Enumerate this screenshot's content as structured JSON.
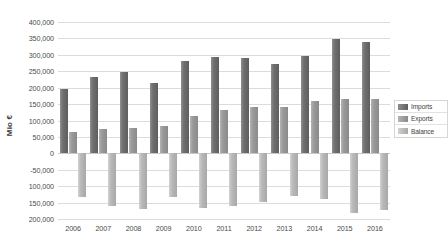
{
  "chart_data": {
    "type": "bar",
    "title": "",
    "subtitle": "",
    "xlabel": "",
    "ylabel": "Mio €",
    "categories": [
      "2006",
      "2007",
      "2008",
      "2009",
      "2010",
      "2011",
      "2012",
      "2013",
      "2014",
      "2015",
      "2016"
    ],
    "series": [
      {
        "name": "Imports",
        "color": "#6f6f6f",
        "values": [
          197000,
          233000,
          248000,
          215000,
          281000,
          292000,
          289000,
          272000,
          296000,
          347000,
          338000
        ]
      },
      {
        "name": "Exports",
        "color": "#9a9a9a",
        "values": [
          64000,
          73000,
          78000,
          83000,
          113000,
          133000,
          141000,
          142000,
          158000,
          166000,
          166000
        ]
      },
      {
        "name": "Balance",
        "color": "#b9b9b9",
        "values": [
          -133000,
          -160000,
          -170000,
          -132000,
          -168000,
          -159000,
          -148000,
          -130000,
          -138000,
          -181000,
          -172000
        ]
      }
    ],
    "ylim": [
      -200000,
      400000
    ],
    "ytick_step": 50000,
    "ytick_labels": [
      "400,000",
      "350,000",
      "300,000",
      "250,000",
      "200,000",
      "150,000",
      "100,000",
      "50,000",
      "0",
      "-50,000",
      "100,000",
      "150,000",
      "200,000"
    ],
    "ytick_values": [
      400000,
      350000,
      300000,
      250000,
      200000,
      150000,
      100000,
      50000,
      0,
      -50000,
      -100000,
      -150000,
      -200000
    ],
    "grid": true,
    "legend_position": "right"
  },
  "legend": {
    "items": [
      {
        "label": "Imports",
        "key": "imports"
      },
      {
        "label": "Exports",
        "key": "exports"
      },
      {
        "label": "Balance",
        "key": "balance"
      }
    ]
  }
}
